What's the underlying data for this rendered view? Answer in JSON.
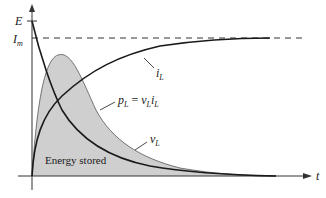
{
  "figure": {
    "axes": {
      "y_label": "E",
      "y_level_label_main": "I",
      "y_level_label_sub": "m",
      "x_label": "t"
    },
    "curves": {
      "current": {
        "main": "i",
        "sub": "L"
      },
      "voltage": {
        "main": "v",
        "sub": "L"
      },
      "power": {
        "lhs_main": "p",
        "lhs_sub": "L",
        "eq": " = ",
        "r1_main": "v",
        "r1_sub": "L",
        "r2_main": "i",
        "r2_sub": "L"
      }
    },
    "region_label": "Energy stored",
    "colors": {
      "shade": "#cfcfcf",
      "curve": "#1a1a1a",
      "axis": "#333333"
    }
  }
}
